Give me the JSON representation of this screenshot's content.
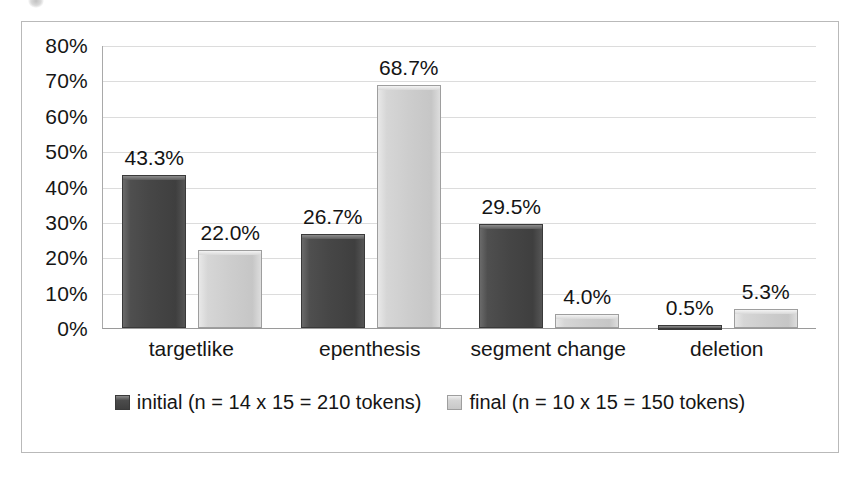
{
  "chart_data": {
    "type": "bar",
    "title": "",
    "subtitle": "",
    "xlabel": "",
    "ylabel": "",
    "categories": [
      "targetlike",
      "epenthesis",
      "segment change",
      "deletion"
    ],
    "series": [
      {
        "name": "initial (n = 14 x 15 = 210 tokens)",
        "key": "initial",
        "color": "#464646",
        "values": [
          43.3,
          26.7,
          29.5,
          0.5
        ],
        "labels": [
          "43.3%",
          "26.7%",
          "29.5%",
          "0.5%"
        ]
      },
      {
        "name": "final (n = 10 x 15 = 150 tokens)",
        "key": "final",
        "color": "#cdcdcd",
        "values": [
          22.0,
          68.7,
          4.0,
          5.3
        ],
        "labels": [
          "22.0%",
          "68.7%",
          "4.0%",
          "5.3%"
        ]
      }
    ],
    "ylim": [
      0,
      80
    ],
    "ytick_step": 10,
    "ytick_labels": [
      "80%",
      "70%",
      "60%",
      "50%",
      "40%",
      "30%",
      "20%",
      "10%",
      "0%"
    ],
    "ytick_values": [
      80,
      70,
      60,
      50,
      40,
      30,
      20,
      10,
      0
    ],
    "grid": true,
    "grid_axis": "y",
    "legend_position": "bottom",
    "value_labels": true
  },
  "legend": {
    "entries": [
      {
        "label": "initial (n = 14 x 15 = 210 tokens)",
        "swatch": "dark-swatch-icon"
      },
      {
        "label": "final (n = 10 x 15 = 150 tokens)",
        "swatch": "light-swatch-icon"
      }
    ]
  }
}
